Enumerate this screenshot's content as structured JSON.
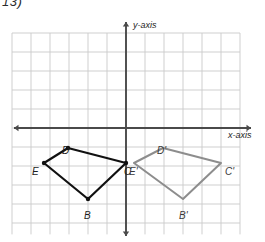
{
  "problem": {
    "number": "13)"
  },
  "axes": {
    "y_label": "y-axis",
    "x_label": "x-axis",
    "origin_px": {
      "x": 126,
      "y": 128
    },
    "cell_px": 19,
    "x_axis_color": "#4a4a4a",
    "y_axis_color": "#4a4a4a",
    "grid_color": "#c9c9c9"
  },
  "chart_data": {
    "type": "scatter",
    "title": "",
    "xlabel": "x-axis",
    "ylabel": "y-axis",
    "grid": true,
    "xlim": [
      -6,
      6
    ],
    "ylim": [
      -5,
      6
    ],
    "annotations": [
      "Quadrilateral BCDE translated to the right to form B'C'D'E'",
      "Point C coincides with point E' at the y-axis"
    ],
    "series": [
      {
        "name": "BCDE",
        "color": "#111111",
        "closed": true,
        "points": [
          {
            "label": "B",
            "x": -2,
            "y": -3.75,
            "px": 88,
            "py": 199
          },
          {
            "label": "C",
            "x": 0,
            "y": -1.85,
            "px": 126,
            "py": 163
          },
          {
            "label": "D",
            "x": -3,
            "y": -1.05,
            "px": 68,
            "py": 148
          },
          {
            "label": "E",
            "x": -4.3,
            "y": -1.85,
            "px": 44,
            "py": 163
          }
        ]
      },
      {
        "name": "B'C'D'E'",
        "color": "#8d8d8d",
        "closed": true,
        "points": [
          {
            "label": "B'",
            "x": 3,
            "y": -3.75,
            "px": 183,
            "py": 199
          },
          {
            "label": "C'",
            "x": 5,
            "y": -1.85,
            "px": 221,
            "py": 163
          },
          {
            "label": "D'",
            "x": 1.95,
            "y": -1.05,
            "px": 163,
            "py": 148
          },
          {
            "label": "E'",
            "x": 0.4,
            "y": -1.85,
            "px": 134,
            "py": 163
          }
        ]
      }
    ]
  },
  "labels": {
    "B": {
      "text": "B",
      "px": 84,
      "py": 210
    },
    "C": {
      "text": "C",
      "px": 124,
      "py": 166
    },
    "D": {
      "text": "D",
      "px": 62,
      "py": 145
    },
    "E": {
      "text": "E",
      "px": 32,
      "py": 166
    },
    "Bp": {
      "text": "B'",
      "px": 179,
      "py": 210
    },
    "Cp": {
      "text": "C'",
      "px": 225,
      "py": 166
    },
    "Dp": {
      "text": "D'",
      "px": 157,
      "py": 145
    },
    "Ep": {
      "text": "E'",
      "px": 129,
      "py": 166
    }
  }
}
